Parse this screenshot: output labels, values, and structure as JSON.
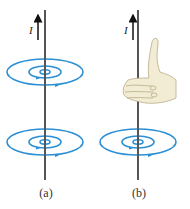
{
  "figure": {
    "panels": [
      {
        "id": "a",
        "label": "(a)",
        "current_label": "I",
        "hand": false
      },
      {
        "id": "b",
        "label": "(b)",
        "current_label": "I",
        "hand": true
      }
    ],
    "colors": {
      "field_lines": "#2a8fd4",
      "wire": "#555555",
      "hand": "#f3ecd4"
    }
  }
}
